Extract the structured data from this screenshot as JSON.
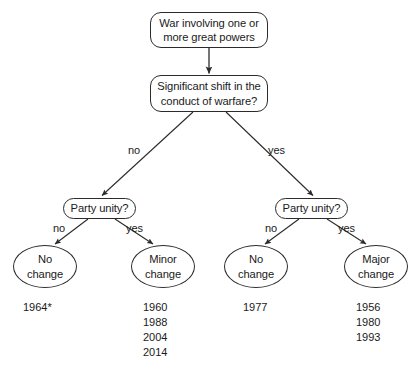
{
  "diagram": {
    "nodes": {
      "root": {
        "line1": "War involving one or",
        "line2": "more great powers"
      },
      "shift_question": {
        "line1": "Significant shift in the",
        "line2": "conduct of warfare?"
      },
      "party_unity_left": {
        "label": "Party unity?"
      },
      "party_unity_right": {
        "label": "Party unity?"
      },
      "outcome_no_change_left": {
        "line1": "No",
        "line2": "change"
      },
      "outcome_minor_change": {
        "line1": "Minor",
        "line2": "change"
      },
      "outcome_no_change_right": {
        "line1": "No",
        "line2": "change"
      },
      "outcome_major_change": {
        "line1": "Major",
        "line2": "change"
      }
    },
    "edge_labels": {
      "shift_no": "no",
      "shift_yes": "yes",
      "left_unity_no": "no",
      "left_unity_yes": "yes",
      "right_unity_no": "no",
      "right_unity_yes": "yes"
    },
    "year_lists": {
      "no_change_left": [
        "1964*"
      ],
      "minor_change": [
        "1960",
        "1988",
        "2004",
        "2014"
      ],
      "no_change_right": [
        "1977"
      ],
      "major_change": [
        "1956",
        "1980",
        "1993"
      ]
    },
    "colors": {
      "stroke": "#2b2b2b",
      "text": "#1a1a1a",
      "background": "#ffffff"
    }
  }
}
